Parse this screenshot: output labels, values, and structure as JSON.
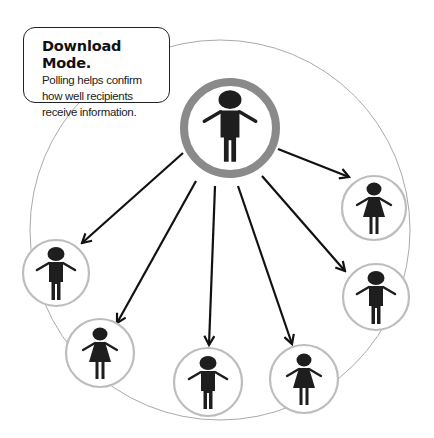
{
  "callout": {
    "title": "Download Mode.",
    "body": "Polling helps confirm how well recipients receive information."
  },
  "colors": {
    "outer_ring": "#aaaaaa",
    "center_ring": "#8a8a8a",
    "node_ring": "#bdbdbd",
    "figure": "#1e1e1e",
    "arrow": "#111111"
  },
  "center_node": {
    "figure": "man",
    "label": "sender"
  },
  "recipients": [
    {
      "figure": "woman",
      "position": "right-top"
    },
    {
      "figure": "man",
      "position": "left"
    },
    {
      "figure": "man",
      "position": "right"
    },
    {
      "figure": "woman",
      "position": "bottom-left"
    },
    {
      "figure": "man",
      "position": "bottom-center"
    },
    {
      "figure": "woman",
      "position": "bottom-right"
    }
  ]
}
